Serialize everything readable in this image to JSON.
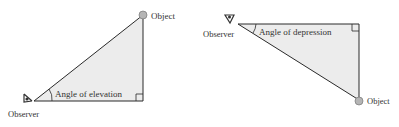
{
  "diagrams": [
    {
      "name": "elevation",
      "observer_label": "Observer",
      "object_label": "Object",
      "angle_label": "Angle of elevation"
    },
    {
      "name": "depression",
      "observer_label": "Observer",
      "object_label": "Object",
      "angle_label": "Angle of depression"
    }
  ],
  "colors": {
    "fill": "#ececec",
    "stroke": "#2a2a2a",
    "object": "#b5b5b5",
    "text": "#333333"
  }
}
